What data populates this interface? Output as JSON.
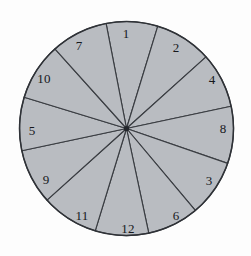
{
  "figure": {
    "shape": "circle",
    "sector_count": 12,
    "background_color": "#fdfdfd",
    "fill_color": "#b9bcc1",
    "stroke_color": "#3a3d42",
    "label_color": "#16181c",
    "center": {
      "x": 126.5,
      "y": 128.5
    },
    "radius": 107
  },
  "chart_data": {
    "type": "pie",
    "xlabel": "",
    "ylabel": "",
    "legend": "none",
    "grid": false,
    "units": "degrees",
    "total_degrees": 360,
    "categories": [
      "1",
      "2",
      "4",
      "8",
      "3",
      "6",
      "12",
      "11",
      "9",
      "5",
      "10",
      "7"
    ],
    "values": [
      28,
      31,
      30,
      31,
      31,
      28,
      29,
      31,
      30,
      29,
      31,
      31
    ],
    "labels": [
      "1",
      "2",
      "4",
      "8",
      "3",
      "6",
      "12",
      "11",
      "9",
      "5",
      "10",
      "7"
    ],
    "slices": [
      {
        "label": "1",
        "start_deg": -101,
        "end_deg": -73,
        "sweep_deg": 28,
        "label_x": 126,
        "label_y": 33
      },
      {
        "label": "2",
        "start_deg": -73,
        "end_deg": -42,
        "sweep_deg": 31,
        "label_x": 176,
        "label_y": 47
      },
      {
        "label": "4",
        "start_deg": -42,
        "end_deg": -12,
        "sweep_deg": 30,
        "label_x": 212,
        "label_y": 79
      },
      {
        "label": "8",
        "start_deg": -12,
        "end_deg": 19,
        "sweep_deg": 31,
        "label_x": 223,
        "label_y": 128
      },
      {
        "label": "3",
        "start_deg": 19,
        "end_deg": 50,
        "sweep_deg": 31,
        "label_x": 209,
        "label_y": 180
      },
      {
        "label": "6",
        "start_deg": 50,
        "end_deg": 78,
        "sweep_deg": 28,
        "label_x": 176,
        "label_y": 215
      },
      {
        "label": "12",
        "start_deg": 78,
        "end_deg": 107,
        "sweep_deg": 29,
        "label_x": 128,
        "label_y": 228
      },
      {
        "label": "11",
        "start_deg": 107,
        "end_deg": 138,
        "sweep_deg": 31,
        "label_x": 82,
        "label_y": 215
      },
      {
        "label": "9",
        "start_deg": 138,
        "end_deg": 168,
        "sweep_deg": 30,
        "label_x": 46,
        "label_y": 179
      },
      {
        "label": "5",
        "start_deg": 168,
        "end_deg": 197,
        "sweep_deg": 29,
        "label_x": 32,
        "label_y": 130
      },
      {
        "label": "10",
        "start_deg": 197,
        "end_deg": 228,
        "sweep_deg": 31,
        "label_x": 44,
        "label_y": 78
      },
      {
        "label": "7",
        "start_deg": 228,
        "end_deg": 259,
        "sweep_deg": 31,
        "label_x": 79,
        "label_y": 45
      }
    ]
  }
}
